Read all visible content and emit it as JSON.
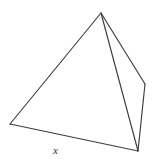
{
  "figure": {
    "type": "tetrahedron",
    "caption_label": "x",
    "canvas": {
      "width": 152,
      "height": 164,
      "background": "#ffffff"
    },
    "stroke": {
      "solid_color": "#3b3b44",
      "hidden_color": "#7d7d88",
      "solid_width": 1.15,
      "hidden_width": 1.0,
      "hidden_dash": "4.5 3.2"
    },
    "vertices": {
      "apex": {
        "name": "apex",
        "x": 101,
        "y": 13
      },
      "left": {
        "name": "left-front",
        "x": 10,
        "y": 124
      },
      "bottom_right": {
        "name": "bottom-front",
        "x": 138,
        "y": 151
      },
      "back_right": {
        "name": "right-back",
        "x": 145,
        "y": 84
      }
    },
    "edges": [
      {
        "name": "apex-to-left",
        "from": "apex",
        "to": "left",
        "style": "solid"
      },
      {
        "name": "apex-to-bottom-right",
        "from": "apex",
        "to": "bottom_right",
        "style": "solid"
      },
      {
        "name": "apex-to-back-right",
        "from": "apex",
        "to": "back_right",
        "style": "solid"
      },
      {
        "name": "left-to-bottom-right",
        "from": "left",
        "to": "bottom_right",
        "style": "solid"
      },
      {
        "name": "back-right-to-bottom-right",
        "from": "back_right",
        "to": "bottom_right",
        "style": "solid"
      },
      {
        "name": "left-to-back-right",
        "from": "left",
        "to": "back_right",
        "style": "hidden"
      }
    ],
    "labels": [
      {
        "name": "base-edge-label",
        "text": "x",
        "x": 53,
        "y": 145,
        "edge": "left-to-bottom-right",
        "style": "italic"
      }
    ]
  }
}
